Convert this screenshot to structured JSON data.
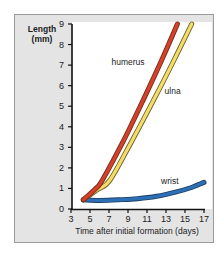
{
  "chart_data": {
    "type": "line",
    "title": "",
    "xlabel": "Time after initial formation (days)",
    "ylabel": "Length (mm)",
    "ylabel_lines": [
      "Length",
      "(mm)"
    ],
    "xlim": [
      3,
      17
    ],
    "ylim": [
      0,
      9
    ],
    "xticks": [
      3,
      5,
      7,
      9,
      11,
      13,
      15,
      17
    ],
    "yticks": [
      0,
      1,
      2,
      3,
      4,
      5,
      6,
      7,
      8,
      9
    ],
    "grid": false,
    "legend": "inline labels",
    "series": [
      {
        "name": "humerus",
        "color": "#d2412a",
        "outline": "#7a2a1a",
        "points": [
          [
            4.3,
            0.45
          ],
          [
            5.5,
            0.95
          ],
          [
            6.3,
            1.4
          ],
          [
            8.5,
            3.3
          ],
          [
            10.6,
            5.3
          ],
          [
            12.5,
            7.2
          ],
          [
            14.2,
            9.0
          ]
        ]
      },
      {
        "name": "ulna",
        "color": "#f3dc6a",
        "outline": "#6e6224",
        "points": [
          [
            4.3,
            0.45
          ],
          [
            5.8,
            0.95
          ],
          [
            7.1,
            1.4
          ],
          [
            9.4,
            3.3
          ],
          [
            11.7,
            5.3
          ],
          [
            13.8,
            7.2
          ],
          [
            15.7,
            9.0
          ]
        ]
      },
      {
        "name": "wrist",
        "color": "#2d6fb5",
        "outline": "#1c3f66",
        "points": [
          [
            4.3,
            0.45
          ],
          [
            6,
            0.42
          ],
          [
            8,
            0.45
          ],
          [
            10,
            0.5
          ],
          [
            12,
            0.62
          ],
          [
            14,
            0.82
          ],
          [
            15.5,
            1.02
          ],
          [
            17,
            1.3
          ]
        ]
      }
    ],
    "annotations": [
      {
        "text": "humerus",
        "x": 9.0,
        "y": 7.0
      },
      {
        "text": "ulna",
        "x": 13.7,
        "y": 5.6
      },
      {
        "text": "wrist",
        "x": 13.4,
        "y": 1.2
      }
    ]
  }
}
